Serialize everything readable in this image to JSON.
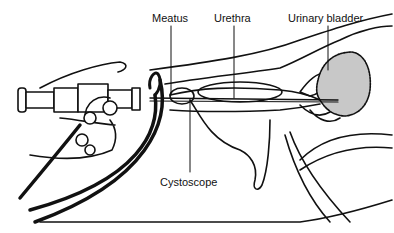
{
  "diagram": {
    "labels": {
      "meatus": "Meatus",
      "urethra": "Urethra",
      "bladder": "Urinary bladder",
      "cystoscope": "Cystoscope"
    },
    "colors": {
      "line": "#111111",
      "bladder_fill": "#c8c8c8",
      "background": "#ffffff"
    }
  }
}
